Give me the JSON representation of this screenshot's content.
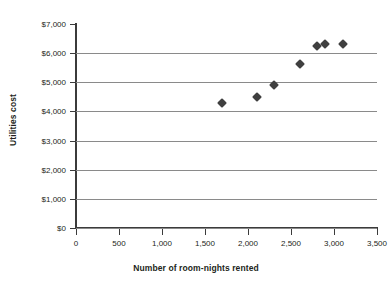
{
  "chart_data": {
    "type": "scatter",
    "title": "",
    "xlabel": "Number of room-nights rented",
    "ylabel": "Utilities cost",
    "xlim": [
      0,
      3500
    ],
    "ylim": [
      0,
      7000
    ],
    "grid": true,
    "legend": null,
    "x_ticks": [
      0,
      500,
      1000,
      1500,
      2000,
      2500,
      3000,
      3500
    ],
    "x_tick_labels": [
      "0",
      "500",
      "1,000",
      "1,500",
      "2,000",
      "2,500",
      "3,000",
      "3,500"
    ],
    "y_ticks": [
      0,
      1000,
      2000,
      3000,
      4000,
      5000,
      6000,
      7000
    ],
    "y_tick_labels": [
      "$0",
      "$1,000",
      "$2,000",
      "$3,000",
      "$4,000",
      "$5,000",
      "$6,000",
      "$7,000"
    ],
    "marker": "diamond",
    "marker_color": "#3f3f3f",
    "grid_color": "#8a8a8a",
    "axis_color": "#3b3b3b",
    "points": [
      {
        "x": 1700,
        "y": 4300
      },
      {
        "x": 2100,
        "y": 4480
      },
      {
        "x": 2300,
        "y": 4900
      },
      {
        "x": 2600,
        "y": 5620
      },
      {
        "x": 2800,
        "y": 6230
      },
      {
        "x": 2900,
        "y": 6300
      },
      {
        "x": 3100,
        "y": 6300
      }
    ]
  }
}
